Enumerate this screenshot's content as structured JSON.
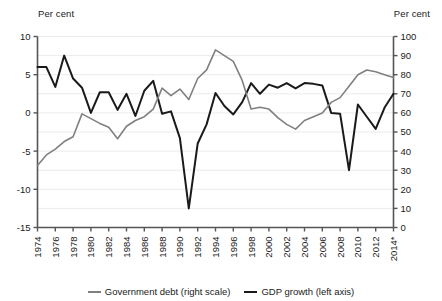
{
  "chart_data": {
    "type": "line",
    "title": "",
    "subtitle": "",
    "xlabel": "",
    "ylabel_left": "Per cent",
    "ylabel_right": "Per cent",
    "grid": true,
    "legend_position": "bottom",
    "x": [
      1974,
      1975,
      1976,
      1977,
      1978,
      1979,
      1980,
      1981,
      1982,
      1983,
      1984,
      1985,
      1986,
      1987,
      1988,
      1989,
      1990,
      1991,
      1992,
      1993,
      1994,
      1995,
      1996,
      1997,
      1998,
      1999,
      2000,
      2001,
      2002,
      2003,
      2004,
      2005,
      2006,
      2007,
      2008,
      2009,
      2010,
      2011,
      2012,
      2013,
      2014
    ],
    "xticklabels": [
      "1974",
      "1976",
      "1978",
      "1980",
      "1982",
      "1984",
      "1986",
      "1988",
      "1990",
      "1992",
      "1994",
      "1996",
      "1998",
      "2000",
      "2002",
      "2004",
      "2006",
      "2008",
      "2010",
      "2012",
      "2014*"
    ],
    "xtickvalues": [
      1974,
      1976,
      1978,
      1980,
      1982,
      1984,
      1986,
      1988,
      1990,
      1992,
      1994,
      1996,
      1998,
      2000,
      2002,
      2004,
      2006,
      2008,
      2010,
      2012,
      2014
    ],
    "xlim": [
      1974,
      2014
    ],
    "ylim_left": [
      -15,
      10
    ],
    "ylim_right": [
      0,
      100
    ],
    "ytickvalues_left": [
      10,
      5,
      0,
      -5,
      -10,
      -15
    ],
    "yticklabels_left": [
      "10",
      "5",
      "0",
      "-5",
      "-10",
      "-15"
    ],
    "ytickvalues_right": [
      100,
      90,
      80,
      70,
      60,
      50,
      40,
      30,
      20,
      10,
      0
    ],
    "yticklabels_right": [
      "100",
      "90",
      "80",
      "70",
      "60",
      "50",
      "40",
      "30",
      "20",
      "10",
      "0"
    ],
    "series": [
      {
        "name": "GDP growth (left axis)",
        "axis": "left",
        "color": "#1a1a1a",
        "values": [
          6.0,
          6.0,
          3.4,
          7.5,
          4.5,
          3.3,
          0.0,
          2.7,
          2.7,
          0.4,
          2.5,
          -0.4,
          2.9,
          4.2,
          -0.1,
          0.2,
          -3.3,
          -12.5,
          -4.0,
          -1.5,
          2.6,
          0.9,
          -0.2,
          1.4,
          3.9,
          2.5,
          3.7,
          3.3,
          3.9,
          3.2,
          3.9,
          3.8,
          3.6,
          0.0,
          -0.1,
          -7.5,
          1.1,
          -0.5,
          -2.1,
          0.7,
          2.5
        ]
      },
      {
        "name": "Government debt (right scale)",
        "axis": "right",
        "color": "#808080",
        "values": [
          32.5,
          38.0,
          41.0,
          45.0,
          47.5,
          59.5,
          57.0,
          54.5,
          52.5,
          46.5,
          53.0,
          56.0,
          58.0,
          62.0,
          73.0,
          69.0,
          72.5,
          67.0,
          78.0,
          82.5,
          93.0,
          90.0,
          87.0,
          77.0,
          62.0,
          63.0,
          62.0,
          57.5,
          54.0,
          51.5,
          56.0,
          58.0,
          60.0,
          65.5,
          68.0,
          74.0,
          80.0,
          82.5,
          81.5,
          80.0,
          78.5
        ]
      }
    ]
  },
  "legend": {
    "entries": [
      {
        "label": "Government debt (right scale)",
        "color": "#808080"
      },
      {
        "label": "GDP growth (left axis)",
        "color": "#1a1a1a"
      }
    ]
  },
  "axes": {
    "left_unit": "Per cent",
    "right_unit": "Per cent"
  }
}
